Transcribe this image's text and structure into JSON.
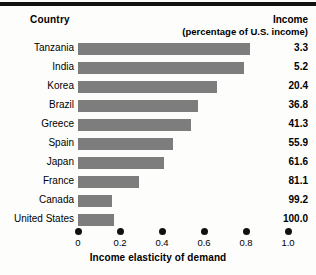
{
  "headers": {
    "country": "Country",
    "income": "Income",
    "income_sub": "(percentage of U.S. income)"
  },
  "axis": {
    "title": "Income elasticity of demand",
    "ticks": [
      "0",
      "0.2",
      "0.4",
      "0.6",
      "0.8",
      "1.0"
    ],
    "tick_values": [
      0,
      0.2,
      0.4,
      0.6,
      0.8,
      1.0
    ]
  },
  "colors": {
    "bar": "#7d7d7d",
    "rule": "#111111",
    "text": "#000000",
    "background": "#fdfdfc"
  },
  "chart_data": {
    "type": "bar",
    "orientation": "horizontal",
    "title": "",
    "xlabel": "Income elasticity of demand",
    "ylabel": "Country",
    "xlim": [
      0,
      1.0
    ],
    "xticks": [
      0,
      0.2,
      0.4,
      0.6,
      0.8,
      1.0
    ],
    "grid": false,
    "legend": null,
    "categories": [
      "Tanzania",
      "India",
      "Korea",
      "Brazil",
      "Greece",
      "Spain",
      "Japan",
      "France",
      "Canada",
      "United States"
    ],
    "values": [
      0.82,
      0.79,
      0.66,
      0.57,
      0.54,
      0.45,
      0.41,
      0.29,
      0.16,
      0.17
    ],
    "series": [
      {
        "name": "Income elasticity of demand",
        "values": [
          0.82,
          0.79,
          0.66,
          0.57,
          0.54,
          0.45,
          0.41,
          0.29,
          0.16,
          0.17
        ]
      },
      {
        "name": "Income (percentage of U.S. income)",
        "values": [
          3.3,
          5.2,
          20.4,
          36.8,
          41.3,
          55.9,
          61.6,
          81.1,
          99.2,
          100.0
        ]
      }
    ],
    "rows": [
      {
        "country": "Tanzania",
        "elasticity": 0.82,
        "income": "3.3"
      },
      {
        "country": "India",
        "elasticity": 0.79,
        "income": "5.2"
      },
      {
        "country": "Korea",
        "elasticity": 0.66,
        "income": "20.4"
      },
      {
        "country": "Brazil",
        "elasticity": 0.57,
        "income": "36.8"
      },
      {
        "country": "Greece",
        "elasticity": 0.54,
        "income": "41.3"
      },
      {
        "country": "Spain",
        "elasticity": 0.45,
        "income": "55.9"
      },
      {
        "country": "Japan",
        "elasticity": 0.41,
        "income": "61.6"
      },
      {
        "country": "France",
        "elasticity": 0.29,
        "income": "81.1"
      },
      {
        "country": "Canada",
        "elasticity": 0.16,
        "income": "99.2"
      },
      {
        "country": "United States",
        "elasticity": 0.17,
        "income": "100.0"
      }
    ]
  }
}
